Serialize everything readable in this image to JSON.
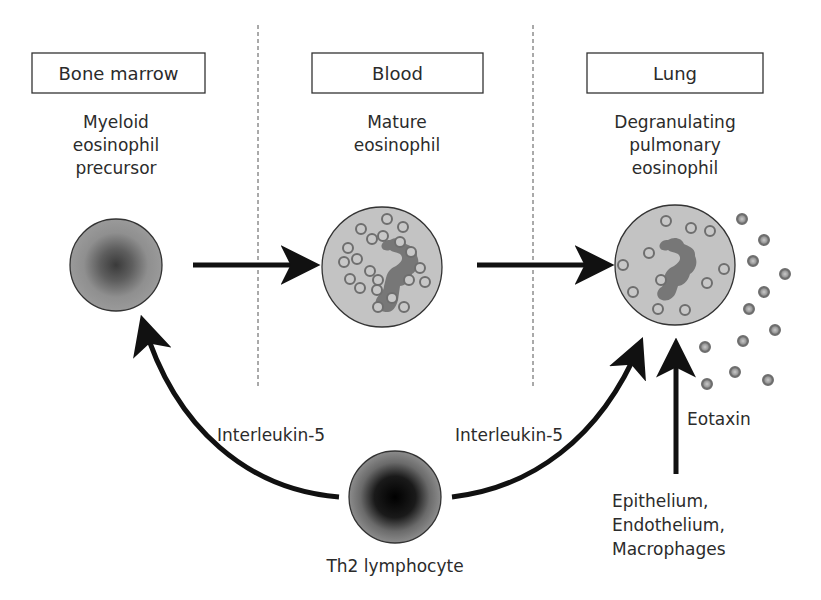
{
  "compartments": [
    {
      "id": "bone-marrow",
      "label": "Bone marrow",
      "cell_label": [
        "Myeloid",
        "eosinophil",
        "precursor"
      ]
    },
    {
      "id": "blood",
      "label": "Blood",
      "cell_label": [
        "Mature",
        "eosinophil"
      ]
    },
    {
      "id": "lung",
      "label": "Lung",
      "cell_label": [
        "Degranulating",
        "pulmonary",
        "eosinophil"
      ]
    }
  ],
  "signals": {
    "left": "Interleukin-5",
    "right": "Interleukin-5",
    "eotaxin": "Eotaxin"
  },
  "th2_label": "Th2 lymphocyte",
  "eotaxin_sources": [
    "Epithelium,",
    "Endothelium,",
    "Macrophages"
  ],
  "colors": {
    "cell_fill": "#c2c2c2",
    "precursor_core": "#4a4a4a",
    "th2_core": "#050505",
    "nucleus": "#7a7a7a",
    "granule": "#a8a8a8",
    "granule_ring": "#6e6e6e",
    "arrow": "#111111",
    "divider": "#555555"
  }
}
